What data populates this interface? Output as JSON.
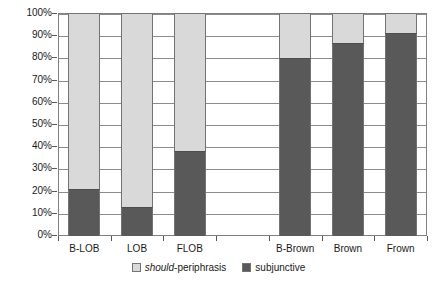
{
  "chart_data": {
    "type": "bar",
    "title": "",
    "subtitle": "",
    "xlabel": "",
    "ylabel": "",
    "stacked": true,
    "normalized_percent": true,
    "grid": true,
    "legend_position": "bottom-center",
    "ylim": [
      0,
      100
    ],
    "ytick_labels": [
      "0%",
      "10%",
      "20%",
      "30%",
      "40%",
      "50%",
      "60%",
      "70%",
      "80%",
      "90%",
      "100%"
    ],
    "ytick_values": [
      0,
      10,
      20,
      30,
      40,
      50,
      60,
      70,
      80,
      90,
      100
    ],
    "categories": [
      "B-LOB",
      "LOB",
      "FLOB",
      "",
      "B-Brown",
      "Brown",
      "Frown"
    ],
    "series": [
      {
        "name": "should-periphrasis",
        "color": "#d9d9d9",
        "values": [
          79,
          87,
          62,
          null,
          20,
          13.5,
          9
        ]
      },
      {
        "name": "subjunctive",
        "color": "#595959",
        "values": [
          21,
          13,
          38,
          null,
          80,
          86.5,
          91
        ]
      }
    ]
  },
  "axis": {
    "y_ticks": [
      {
        "label": "100%",
        "value": 100
      },
      {
        "label": "90%",
        "value": 90
      },
      {
        "label": "80%",
        "value": 80
      },
      {
        "label": "70%",
        "value": 70
      },
      {
        "label": "60%",
        "value": 60
      },
      {
        "label": "50%",
        "value": 50
      },
      {
        "label": "40%",
        "value": 40
      },
      {
        "label": "30%",
        "value": 30
      },
      {
        "label": "20%",
        "value": 20
      },
      {
        "label": "10%",
        "value": 10
      },
      {
        "label": "0%",
        "value": 0
      }
    ],
    "x_ticks": [
      "B-LOB",
      "LOB",
      "FLOB",
      "",
      "B-Brown",
      "Brown",
      "Frown"
    ]
  },
  "legend": {
    "entries": [
      {
        "label_italic": "should",
        "label_rest": "-periphrasis",
        "swatch": "light-grey-swatch",
        "color": "#d9d9d9"
      },
      {
        "label_italic": "",
        "label_rest": "subjunctive",
        "swatch": "dark-grey-swatch",
        "color": "#595959"
      }
    ]
  },
  "colors": {
    "should_periphrasis": "#d9d9d9",
    "subjunctive": "#595959",
    "gridline": "#8c8c8c",
    "frame": "#808080",
    "text": "#1a1a1a",
    "background": "#ffffff"
  }
}
